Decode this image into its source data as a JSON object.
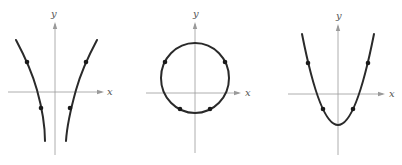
{
  "figure": {
    "graphs": [
      {
        "id": "graph-1",
        "shape": "hyperbola-like (two branches)",
        "x_label": "x",
        "y_label": "y",
        "points": 4
      },
      {
        "id": "graph-2",
        "shape": "circle",
        "x_label": "x",
        "y_label": "y",
        "points": 4
      },
      {
        "id": "graph-3",
        "shape": "parabola",
        "x_label": "x",
        "y_label": "y",
        "points": 4
      }
    ]
  },
  "colors": {
    "axis": "#9a9a9a",
    "curve": "#2a2a2a",
    "dot": "#1a1a1a",
    "background": "#ffffff"
  }
}
